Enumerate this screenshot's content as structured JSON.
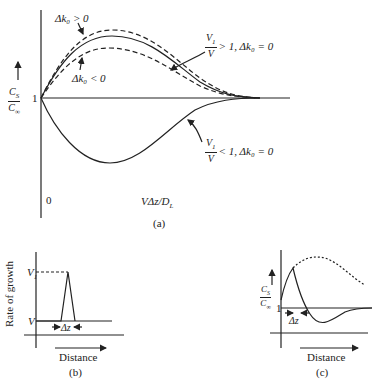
{
  "panel_a": {
    "caption": "(a)",
    "y_label_num": "C",
    "y_label_num_sub": "S",
    "y_label_den": "C",
    "y_label_den_sub": "∞",
    "y_tick_1": "1",
    "origin": "0",
    "x_label": "VΔz/D",
    "x_label_sub": "L",
    "annot_dk_pos": "Δk₀ > 0",
    "annot_dk_neg": "Δk₀ < 0",
    "annot_gt_num": "V",
    "annot_gt_num_sub": "1",
    "annot_gt_den": "V",
    "annot_gt_rest": "> 1, Δk₀ = 0",
    "annot_lt_num": "V",
    "annot_lt_num_sub": "1",
    "annot_lt_den": "V",
    "annot_lt_rest": "< 1, Δk₀ = 0"
  },
  "panel_b": {
    "caption": "(b)",
    "y_label": "Rate of growth",
    "v1_label": "V",
    "v1_sub": "1",
    "v_label": "V",
    "dz_label": "Δz",
    "x_label": "Distance"
  },
  "panel_c": {
    "caption": "(c)",
    "y_label_num": "C",
    "y_label_num_sub": "S",
    "y_label_den": "C",
    "y_label_den_sub": "∞",
    "y_tick_1": "1",
    "dz_label": "Δz",
    "x_label": "Distance"
  },
  "colors": {
    "ink": "#222222",
    "background": "#ffffff"
  }
}
